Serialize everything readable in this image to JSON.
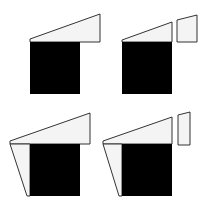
{
  "diagram": {
    "width": 206,
    "height": 212,
    "colors": {
      "background": "#ffffff",
      "fill_light": "#f4f4f4",
      "stroke": "#333333",
      "block": "#000000"
    },
    "panels": [
      {
        "id": "top-left",
        "shapes": [
          {
            "name": "wedge-top",
            "points": "30,119 100,94 100,127 30,127"
          },
          {
            "name": "block",
            "x": 30,
            "y": 42,
            "w": 50,
            "h": 52
          }
        ]
      }
    ]
  }
}
